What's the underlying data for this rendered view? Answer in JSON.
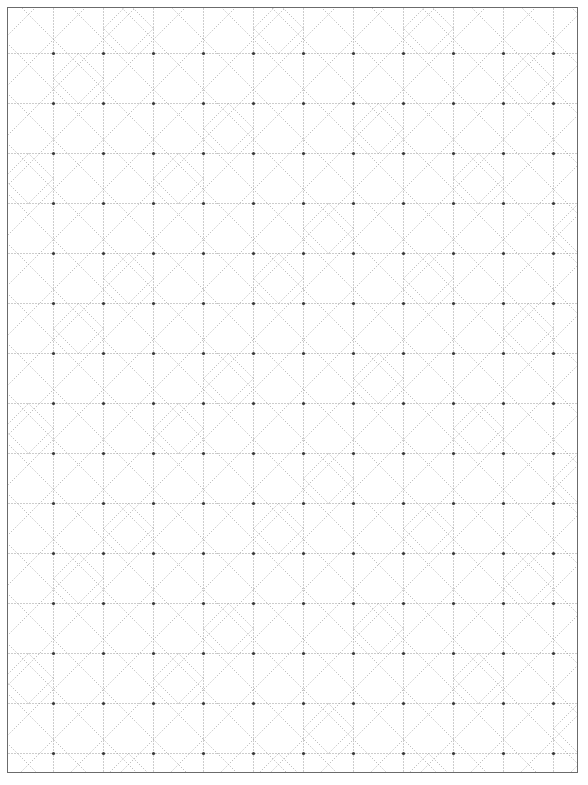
{
  "document": {
    "title": "Dotted Grid Pattern Sheet",
    "kind": "grid-paper",
    "description": "Square dotted grid paper with diagonal construction lines and inscribed diamond motifs",
    "width_px": 588,
    "height_px": 785
  },
  "frame": {
    "name": "sheet-border",
    "left_px": 7,
    "top_px": 7,
    "width_px": 571,
    "height_px": 766,
    "border_px": 1,
    "border_color": "#6b6b6b",
    "background_color": "#ffffff"
  },
  "grid": {
    "cell_px": 50,
    "origin_x_px": -5,
    "origin_y_px": -5,
    "columns": 12,
    "rows": 16,
    "line_color": "#9a9a9a",
    "dot_color": "#3a3a3a",
    "diagonal_color": "#a9a9a9",
    "dash_on_px": 1,
    "dash_off_px": 2,
    "line_width_px": 1,
    "node_radius_px": 1.6
  },
  "chart_data": {
    "type": "pattern",
    "title": "Dotted Grid Pattern Sheet",
    "xlabel": "",
    "ylabel": "",
    "cell_size": 50,
    "columns": 12,
    "rows": 16,
    "legend": [],
    "layers": [
      {
        "name": "orthogonal-dotted-lines",
        "orientation": "horizontal-and-vertical",
        "spacing": 50,
        "color": "#9a9a9a"
      },
      {
        "name": "main-diagonals",
        "orientation": "both-45-degree",
        "spacing": 50,
        "color": "#a9a9a9"
      },
      {
        "name": "half-cell-diamonds",
        "orientation": "midpoint-inscribed",
        "spacing": 50,
        "color": "#a9a9a9"
      },
      {
        "name": "lattice-nodes",
        "orientation": "intersections",
        "spacing": 50,
        "color": "#3a3a3a"
      }
    ],
    "diamond_cells": [
      [
        2,
        0
      ],
      [
        5,
        0
      ],
      [
        8,
        0
      ],
      [
        10,
        1
      ],
      [
        1,
        1
      ],
      [
        4,
        2
      ],
      [
        7,
        2
      ],
      [
        0,
        3
      ],
      [
        3,
        3
      ],
      [
        9,
        3
      ],
      [
        6,
        4
      ],
      [
        11,
        4
      ],
      [
        2,
        5
      ],
      [
        5,
        5
      ],
      [
        8,
        5
      ],
      [
        1,
        6
      ],
      [
        10,
        6
      ],
      [
        4,
        7
      ],
      [
        7,
        7
      ],
      [
        0,
        8
      ],
      [
        3,
        8
      ],
      [
        9,
        8
      ],
      [
        6,
        9
      ],
      [
        11,
        9
      ],
      [
        2,
        10
      ],
      [
        5,
        10
      ],
      [
        8,
        10
      ],
      [
        1,
        11
      ],
      [
        10,
        11
      ],
      [
        4,
        12
      ],
      [
        7,
        12
      ],
      [
        0,
        13
      ],
      [
        3,
        13
      ],
      [
        9,
        13
      ],
      [
        6,
        14
      ],
      [
        11,
        14
      ],
      [
        2,
        15
      ],
      [
        5,
        15
      ],
      [
        8,
        15
      ]
    ],
    "diagonal_pattern_note": "Alternating forward and backward 45-degree dotted diagonals across every cell, with inscribed diamonds joining cell edge midpoints in selected cells"
  }
}
